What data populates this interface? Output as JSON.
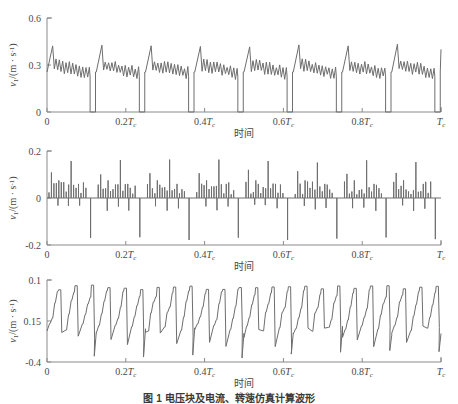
{
  "figure": {
    "caption": "图 1  电压块及电流、转速仿真计算波形",
    "line_color": "#6e6e6e",
    "axis_color": "#8a8a8a",
    "background": "#ffffff"
  },
  "chart_data": [
    {
      "type": "line",
      "panel": "(a)",
      "title": "",
      "xlabel": "时间",
      "ylabel": "v/(m · s⁻¹)",
      "xticklabels": [
        "0",
        "0.2Tc",
        "0.4Tc",
        "0.6Tc",
        "0.8Tc",
        "Tc"
      ],
      "xtickvalues": [
        0,
        0.2,
        0.4,
        0.6,
        0.8,
        1.0
      ],
      "yticklabels": [
        "0",
        "0.3",
        "0.6"
      ],
      "ytickvalues": [
        0,
        0.3,
        0.6
      ],
      "xlim": [
        0,
        1
      ],
      "ylim": [
        0,
        0.6
      ],
      "grid": false,
      "legend": null,
      "cycles": 8,
      "description": "Periodic sawtooth: rapid rise to ~0.42 peak, noisy decaying plateau near 0.25, then vertical drop to 0 at each cycle end",
      "series": [
        {
          "name": "v",
          "x": [
            0.0,
            0.004,
            0.008,
            0.012,
            0.016,
            0.02,
            0.024,
            0.028,
            0.032,
            0.036,
            0.04,
            0.044,
            0.048,
            0.052,
            0.056,
            0.06,
            0.064,
            0.068,
            0.072,
            0.076,
            0.08,
            0.084,
            0.088,
            0.092,
            0.096,
            0.1,
            0.104,
            0.108,
            0.112,
            0.116,
            0.12,
            0.124,
            0.125
          ],
          "values": [
            0.255,
            0.3,
            0.345,
            0.42,
            0.3,
            0.255,
            0.28,
            0.24,
            0.3,
            0.255,
            0.235,
            0.29,
            0.25,
            0.225,
            0.285,
            0.245,
            0.23,
            0.28,
            0.255,
            0.23,
            0.275,
            0.25,
            0.235,
            0.27,
            0.245,
            0.24,
            0.265,
            0.25,
            0.24,
            0.255,
            0.245,
            0.24,
            0.0
          ]
        }
      ]
    },
    {
      "type": "line",
      "panel": "(b)",
      "title": "",
      "xlabel": "时间",
      "ylabel": "v/(m · s⁻¹)",
      "xticklabels": [
        "0",
        "0.2Tc",
        "0.4Tc",
        "0.6Tc",
        "0.8Tc",
        "Tc"
      ],
      "xtickvalues": [
        0,
        0.2,
        0.4,
        0.6,
        0.8,
        1.0
      ],
      "yticklabels": [
        "-0.2",
        "0",
        "0.2"
      ],
      "ytickvalues": [
        -0.2,
        0,
        0.2
      ],
      "xlim": [
        0,
        1
      ],
      "ylim": [
        -0.2,
        0.2
      ],
      "grid": false,
      "legend": null,
      "cycles": 8,
      "description": "Impulse train: small positive spikes 0.02-0.16 clustered through each cycle, large negative spike to about -0.17 at each cycle boundary",
      "series": [
        {
          "name": "v",
          "spikes_positive": [
            0.1,
            0.04,
            0.07,
            0.09,
            0.05,
            0.03,
            0.06,
            0.04,
            0.03,
            0.05,
            0.02,
            0.04,
            0.03,
            0.06,
            0.16,
            0.05,
            0.03,
            0.04,
            0.02,
            0.03
          ],
          "spikes_negative": [
            -0.17,
            -0.16,
            -0.18,
            -0.17,
            -0.16,
            -0.18,
            -0.17,
            -0.17
          ]
        }
      ]
    },
    {
      "type": "line",
      "panel": "(c)",
      "title": "",
      "xlabel": "时间",
      "ylabel": "v/(m · s⁻¹)",
      "xticklabels": [
        "0",
        "0.2Tc",
        "0.4Tc",
        "0.6Tc",
        "0.8Tc",
        "Tc"
      ],
      "xtickvalues": [
        0,
        0.2,
        0.4,
        0.6,
        0.8,
        1.0
      ],
      "yticklabels": [
        "-0.4",
        "0.15",
        "0.1"
      ],
      "ytickvalues": [
        -0.4,
        0.15,
        0.1
      ],
      "xlim": [
        0,
        1
      ],
      "ylim": [
        -0.4,
        0.1
      ],
      "grid": false,
      "legend": null,
      "cycles": 8,
      "description": "Stepped zigzag oscillation with flat tops near upper limit and sharp descents toward the lower limit each cycle",
      "series": [
        {
          "name": "v",
          "values": [
            -0.22,
            -0.1,
            -0.18,
            -0.06,
            -0.14,
            -0.02,
            0.02,
            0.04,
            -0.12,
            -0.04,
            0.04,
            -0.2,
            -0.3,
            -0.08,
            0.0,
            -0.16,
            -0.06,
            0.04,
            -0.26,
            -0.34
          ]
        }
      ]
    }
  ]
}
